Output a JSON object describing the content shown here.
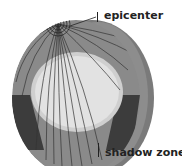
{
  "diagram": {
    "labels": {
      "epicenter": "epicenter",
      "shadow_zone": "shadow zone"
    },
    "colors": {
      "mantle": "#8a8a8a",
      "core": "#d9d9d9",
      "shadow": "#3c3c3c",
      "rim": "#6e6e6e",
      "rays": "#333333"
    }
  }
}
